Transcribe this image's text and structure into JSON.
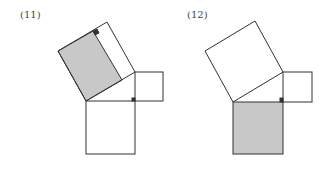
{
  "figures": [
    {
      "label": "(11)",
      "shaded": "rectangle part of hypotenuse square",
      "colors": {
        "stroke": "#333333",
        "fill": "#c8c8c8",
        "marker": "#333333"
      }
    },
    {
      "label": "(12)",
      "shaded": "bottom leg square",
      "colors": {
        "stroke": "#333333",
        "fill": "#c8c8c8",
        "marker": "#333333"
      }
    }
  ]
}
